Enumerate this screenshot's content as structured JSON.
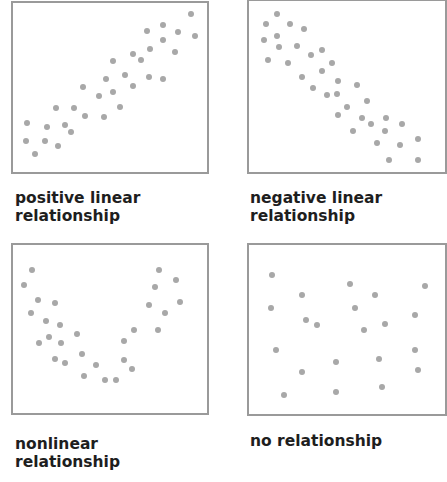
{
  "chart_data": [
    {
      "type": "scatter",
      "title": "positive linear relationship",
      "caption_lines": [
        "positive linear",
        "relationship"
      ],
      "grid": false,
      "axes_visible": false,
      "points": [
        [
          27,
          123
        ],
        [
          26,
          141
        ],
        [
          35,
          154
        ],
        [
          47,
          127
        ],
        [
          45,
          141
        ],
        [
          58,
          146
        ],
        [
          56,
          108
        ],
        [
          65,
          125
        ],
        [
          71,
          132
        ],
        [
          74,
          108
        ],
        [
          85,
          116
        ],
        [
          83,
          87
        ],
        [
          104,
          117
        ],
        [
          99,
          96
        ],
        [
          113,
          92
        ],
        [
          106,
          79
        ],
        [
          120,
          107
        ],
        [
          125,
          75
        ],
        [
          133,
          86
        ],
        [
          113,
          61
        ],
        [
          141,
          60
        ],
        [
          150,
          49
        ],
        [
          133,
          54
        ],
        [
          149,
          77
        ],
        [
          163,
          79
        ],
        [
          147,
          31
        ],
        [
          163,
          25
        ],
        [
          178,
          32
        ],
        [
          175,
          52
        ],
        [
          163,
          40
        ],
        [
          191,
          14
        ],
        [
          195,
          36
        ]
      ]
    },
    {
      "type": "scatter",
      "title": "negative linear relationship",
      "caption_lines": [
        "negative linear",
        "relationship"
      ],
      "grid": false,
      "axes_visible": false,
      "points": [
        [
          266,
          24
        ],
        [
          277,
          14
        ],
        [
          264,
          40
        ],
        [
          277,
          36
        ],
        [
          290,
          24
        ],
        [
          304,
          29
        ],
        [
          279,
          47
        ],
        [
          297,
          46
        ],
        [
          268,
          60
        ],
        [
          288,
          63
        ],
        [
          311,
          55
        ],
        [
          322,
          50
        ],
        [
          302,
          77
        ],
        [
          322,
          71
        ],
        [
          332,
          63
        ],
        [
          313,
          88
        ],
        [
          327,
          95
        ],
        [
          337,
          94
        ],
        [
          338,
          81
        ],
        [
          357,
          85
        ],
        [
          347,
          107
        ],
        [
          338,
          115
        ],
        [
          367,
          101
        ],
        [
          362,
          118
        ],
        [
          371,
          124
        ],
        [
          386,
          118
        ],
        [
          385,
          131
        ],
        [
          402,
          124
        ],
        [
          353,
          131
        ],
        [
          377,
          143
        ],
        [
          400,
          145
        ],
        [
          418,
          139
        ],
        [
          389,
          160
        ],
        [
          418,
          160
        ]
      ]
    },
    {
      "type": "scatter",
      "title": "nonlinear relationship",
      "caption_lines": [
        "nonlinear",
        "relationship"
      ],
      "grid": false,
      "axes_visible": false,
      "points": [
        [
          32,
          270
        ],
        [
          24,
          285
        ],
        [
          38,
          300
        ],
        [
          55,
          303
        ],
        [
          31,
          313
        ],
        [
          46,
          321
        ],
        [
          60,
          325
        ],
        [
          39,
          343
        ],
        [
          49,
          337
        ],
        [
          61,
          343
        ],
        [
          77,
          334
        ],
        [
          55,
          359
        ],
        [
          65,
          363
        ],
        [
          82,
          354
        ],
        [
          84,
          376
        ],
        [
          96,
          365
        ],
        [
          105,
          380
        ],
        [
          116,
          380
        ],
        [
          124,
          360
        ],
        [
          132,
          369
        ],
        [
          124,
          341
        ],
        [
          134,
          330
        ],
        [
          149,
          305
        ],
        [
          158,
          330
        ],
        [
          155,
          287
        ],
        [
          159,
          270
        ],
        [
          176,
          280
        ],
        [
          165,
          313
        ],
        [
          180,
          302
        ]
      ]
    },
    {
      "type": "scatter",
      "title": "no relationship",
      "caption_lines": [
        "no relationship"
      ],
      "grid": false,
      "axes_visible": false,
      "points": [
        [
          272,
          275
        ],
        [
          271,
          308
        ],
        [
          276,
          350
        ],
        [
          302,
          295
        ],
        [
          317,
          325
        ],
        [
          306,
          320
        ],
        [
          302,
          372
        ],
        [
          284,
          395
        ],
        [
          336,
          362
        ],
        [
          350,
          284
        ],
        [
          355,
          308
        ],
        [
          364,
          330
        ],
        [
          375,
          295
        ],
        [
          385,
          324
        ],
        [
          379,
          359
        ],
        [
          336,
          392
        ],
        [
          382,
          387
        ],
        [
          415,
          315
        ],
        [
          415,
          350
        ],
        [
          418,
          370
        ],
        [
          425,
          286
        ]
      ]
    }
  ],
  "style": {
    "dot_color": "#a8a8a8",
    "border_color": "#9a9a9a",
    "text_color": "#1e1e1e"
  }
}
